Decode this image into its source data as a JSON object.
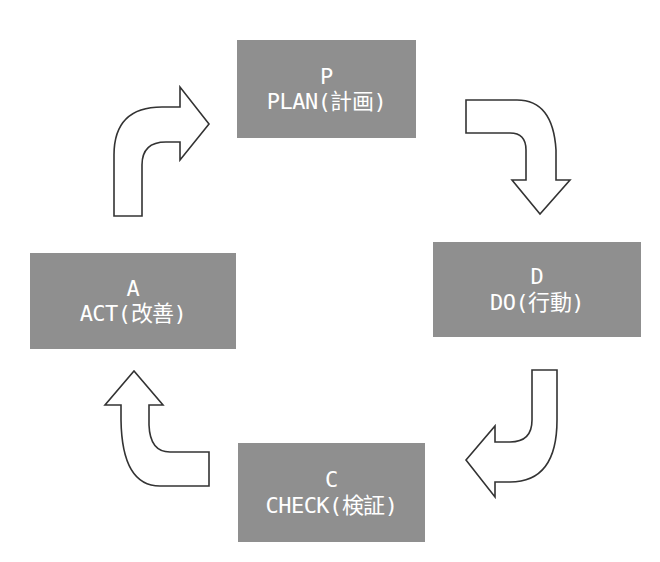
{
  "diagram": {
    "colors": {
      "box_fill": "#8f8f8f",
      "box_text": "#ffffff",
      "arrow_stroke": "#333333",
      "arrow_fill": "#ffffff"
    },
    "nodes": [
      {
        "id": "plan",
        "letter": "P",
        "label": "PLAN(計画)"
      },
      {
        "id": "do",
        "letter": "D",
        "label": "DO(行動)"
      },
      {
        "id": "check",
        "letter": "C",
        "label": "CHECK(検証)"
      },
      {
        "id": "act",
        "letter": "A",
        "label": "ACT(改善)"
      }
    ],
    "edges": [
      {
        "from": "plan",
        "to": "do"
      },
      {
        "from": "do",
        "to": "check"
      },
      {
        "from": "check",
        "to": "act"
      },
      {
        "from": "act",
        "to": "plan"
      }
    ]
  }
}
